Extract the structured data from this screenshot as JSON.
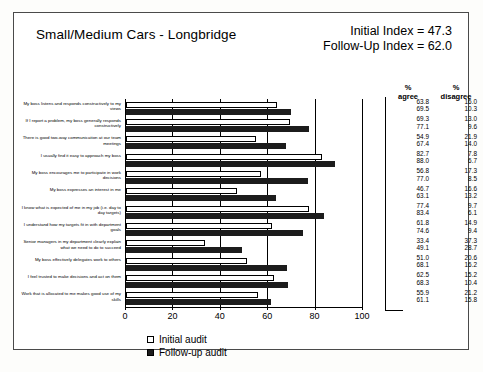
{
  "header": {
    "title": "Small/Medium Cars - Longbridge",
    "initial_index": "Initial Index = 47.3",
    "followup_index": "Follow-Up Index = 62.0"
  },
  "table": {
    "agree_header_1": "%",
    "agree_header_2": "agree",
    "disagree_header_1": "%",
    "disagree_header_2": "disagree"
  },
  "legend": {
    "initial": "Initial audit",
    "followup": "Follow-up audit"
  },
  "chart_data": {
    "type": "bar",
    "title": "Small/Medium Cars - Longbridge",
    "xlabel": "",
    "ylabel": "",
    "xlim": [
      0,
      100
    ],
    "ticks": [
      "0",
      "20",
      "40",
      "60",
      "80",
      "100"
    ],
    "grid": true,
    "legend_position": "bottom",
    "orientation": "horizontal",
    "categories": [
      "My boss listens and responds constructively to my views",
      "If I report a problem, my boss generally responds constructively",
      "There is good two-way communication at our team meetings",
      "I usually find it easy to approach my boss",
      "My boss encourages me to participate in work decisions",
      "My boss expresses an interest in me",
      "I know what is expected of me in my job (i.e. day to day targets)",
      "I understand how my targets fit in with department goals",
      "Senior managers in my department clearly explain what we need to do to succeed",
      "My boss effectively delegates work to others",
      "I feel trusted to make decisions and act on them",
      "Work that is allocated to me makes good use of my skills"
    ],
    "series": [
      {
        "name": "Initial audit",
        "values": [
          63.8,
          69.3,
          54.9,
          82.7,
          56.8,
          46.7,
          77.4,
          61.8,
          33.4,
          51.0,
          62.5,
          55.9
        ]
      },
      {
        "name": "Follow-up audit",
        "values": [
          69.5,
          77.1,
          67.4,
          88.0,
          77.0,
          63.1,
          83.4,
          74.6,
          49.1,
          68.1,
          68.3,
          61.1
        ]
      }
    ],
    "value_table": {
      "columns": [
        "% agree",
        "% disagree"
      ],
      "rows": [
        {
          "agree": "63.8",
          "disagree": "16.0"
        },
        {
          "agree": "69.5",
          "disagree": "10.3"
        },
        {
          "agree": "69.3",
          "disagree": "13.0"
        },
        {
          "agree": "77.1",
          "disagree": "9.6"
        },
        {
          "agree": "54.9",
          "disagree": "21.9"
        },
        {
          "agree": "67.4",
          "disagree": "14.0"
        },
        {
          "agree": "82.7",
          "disagree": "7.8"
        },
        {
          "agree": "88.0",
          "disagree": "6.7"
        },
        {
          "agree": "56.8",
          "disagree": "17.3"
        },
        {
          "agree": "77.0",
          "disagree": "8.5"
        },
        {
          "agree": "46.7",
          "disagree": "16.6"
        },
        {
          "agree": "63.1",
          "disagree": "13.2"
        },
        {
          "agree": "77.4",
          "disagree": "9.7"
        },
        {
          "agree": "83.4",
          "disagree": "6.1"
        },
        {
          "agree": "61.8",
          "disagree": "14.9"
        },
        {
          "agree": "74.6",
          "disagree": "9.4"
        },
        {
          "agree": "33.4",
          "disagree": "37.3"
        },
        {
          "agree": "49.1",
          "disagree": "28.7"
        },
        {
          "agree": "51.0",
          "disagree": "20.6"
        },
        {
          "agree": "68.1",
          "disagree": "16.2"
        },
        {
          "agree": "62.5",
          "disagree": "15.2"
        },
        {
          "agree": "68.3",
          "disagree": "10.4"
        },
        {
          "agree": "55.9",
          "disagree": "21.2"
        },
        {
          "agree": "61.1",
          "disagree": "15.8"
        }
      ]
    }
  }
}
